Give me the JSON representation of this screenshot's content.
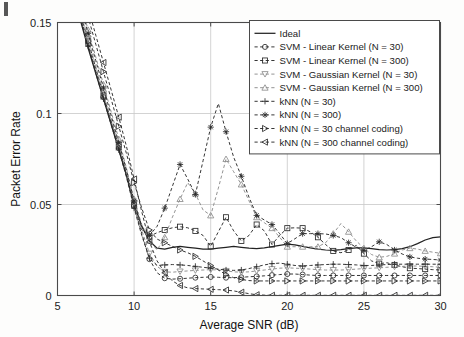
{
  "figure": {
    "background": "#fdfdfc",
    "axis_color": "#4a4a4a",
    "grid_color": "#c8c8c8",
    "series_color": "#2b2b2b",
    "gray_series_color": "#8d8d8d"
  },
  "axes": {
    "xlabel": "Average SNR (dB)",
    "ylabel": "Packet Error Rate",
    "xticks": [
      "5",
      "10",
      "15",
      "20",
      "25",
      "30"
    ],
    "yticks": [
      "0",
      "0.05",
      "0.1",
      "0.15"
    ],
    "xlim": [
      5,
      30
    ],
    "ylim": [
      0,
      0.15
    ],
    "grid": true
  },
  "legend": {
    "position": "top-right",
    "entries": [
      {
        "label": "Ideal",
        "marker": "none",
        "dash": "solid",
        "color": "#222222"
      },
      {
        "label": "SVM - Linear Kernel (N = 30)",
        "marker": "circle",
        "dash": "dashed",
        "color": "#2b2b2b"
      },
      {
        "label": "SVM - Linear Kernel (N = 300)",
        "marker": "square",
        "dash": "dashed",
        "color": "#2b2b2b"
      },
      {
        "label": "SVM - Gaussian Kernel (N = 30)",
        "marker": "triangle-down",
        "dash": "dashed",
        "color": "#8d8d8d"
      },
      {
        "label": "SVM - Gaussian Kernel (N = 300)",
        "marker": "triangle-up",
        "dash": "dashed",
        "color": "#8d8d8d"
      },
      {
        "label": "kNN (N = 30)",
        "marker": "plus",
        "dash": "dashed",
        "color": "#2b2b2b"
      },
      {
        "label": "kNN (N = 300)",
        "marker": "star",
        "dash": "dashed",
        "color": "#2b2b2b"
      },
      {
        "label": "kNN (N = 30 channel coding)",
        "marker": "triangle-right",
        "dash": "dashed",
        "color": "#2b2b2b"
      },
      {
        "label": "kNN (N = 300 channel coding)",
        "marker": "triangle-left",
        "dash": "dashed",
        "color": "#2b2b2b"
      }
    ]
  },
  "chart_data": {
    "type": "line",
    "title": "",
    "xlabel": "Average SNR (dB)",
    "ylabel": "Packet Error Rate",
    "xlim": [
      5,
      30
    ],
    "ylim": [
      0,
      0.15
    ],
    "grid": true,
    "legend_position": "top-right",
    "x": [
      5,
      5.5,
      6,
      6.5,
      7,
      7.5,
      8,
      8.5,
      9,
      9.5,
      10,
      10.5,
      11,
      11.5,
      12,
      12.5,
      13,
      13.5,
      14,
      14.5,
      15,
      15.5,
      16,
      16.5,
      17,
      17.5,
      18,
      18.5,
      19,
      19.5,
      20,
      20.5,
      21,
      21.5,
      22,
      22.5,
      23,
      23.5,
      24,
      24.5,
      25,
      25.5,
      26,
      26.5,
      27,
      27.5,
      28,
      28.5,
      29,
      29.5,
      30
    ],
    "series": [
      {
        "name": "Ideal",
        "marker": "none",
        "dash": "solid",
        "color": "#222222",
        "values": [
          0.196,
          0.181,
          0.166,
          0.151,
          0.136,
          0.122,
          0.108,
          0.094,
          0.08,
          0.066,
          0.05,
          0.038,
          0.03,
          0.026,
          0.0255,
          0.0265,
          0.027,
          0.0265,
          0.026,
          0.0255,
          0.0255,
          0.026,
          0.0265,
          0.027,
          0.0265,
          0.026,
          0.0258,
          0.0262,
          0.0268,
          0.0275,
          0.0282,
          0.0278,
          0.027,
          0.0262,
          0.0255,
          0.025,
          0.0248,
          0.0252,
          0.0258,
          0.0262,
          0.0262,
          0.0258,
          0.0252,
          0.025,
          0.0252,
          0.0258,
          0.0268,
          0.0285,
          0.0305,
          0.0318,
          0.0322
        ]
      },
      {
        "name": "SVM - Linear Kernel (N = 30)",
        "marker": "circle",
        "dash": "dashed",
        "color": "#2b2b2b",
        "values": [
          0.198,
          0.183,
          0.168,
          0.153,
          0.138,
          0.123,
          0.109,
          0.095,
          0.081,
          0.066,
          0.049,
          0.034,
          0.02,
          0.0125,
          0.0095,
          0.009,
          0.0092,
          0.0095,
          0.0098,
          0.01,
          0.0102,
          0.01,
          0.0098,
          0.0098,
          0.01,
          0.0103,
          0.0105,
          0.0108,
          0.0112,
          0.0115,
          0.0118,
          0.0118,
          0.0115,
          0.0112,
          0.011,
          0.011,
          0.011,
          0.011,
          0.011,
          0.011,
          0.011,
          0.011,
          0.011,
          0.011,
          0.011,
          0.011,
          0.011,
          0.011,
          0.011,
          0.011,
          0.011
        ]
      },
      {
        "name": "SVM - Linear Kernel (N = 300)",
        "marker": "square",
        "dash": "dashed",
        "color": "#2b2b2b",
        "values": [
          0.2,
          0.185,
          0.17,
          0.155,
          0.14,
          0.125,
          0.11,
          0.096,
          0.082,
          0.067,
          0.05,
          0.036,
          0.0325,
          0.0345,
          0.036,
          0.0372,
          0.0378,
          0.0372,
          0.0355,
          0.033,
          0.027,
          0.035,
          0.043,
          0.0355,
          0.03,
          0.033,
          0.039,
          0.0355,
          0.028,
          0.033,
          0.037,
          0.0372,
          0.037,
          0.035,
          0.032,
          0.028,
          0.0245,
          0.0235,
          0.025,
          0.0275,
          0.023,
          0.019,
          0.0175,
          0.018,
          0.0168,
          0.0158,
          0.015,
          0.0148,
          0.0145,
          0.0142,
          0.014
        ]
      },
      {
        "name": "SVM - Gaussian Kernel (N = 30)",
        "marker": "triangle-down",
        "dash": "dashed",
        "color": "#8d8d8d",
        "values": [
          0.201,
          0.186,
          0.171,
          0.156,
          0.141,
          0.126,
          0.111,
          0.097,
          0.083,
          0.068,
          0.051,
          0.036,
          0.023,
          0.016,
          0.013,
          0.0128,
          0.0132,
          0.0135,
          0.0138,
          0.014,
          0.0142,
          0.014,
          0.0135,
          0.013,
          0.0128,
          0.013,
          0.0135,
          0.014,
          0.0145,
          0.015,
          0.0152,
          0.015,
          0.0148,
          0.0145,
          0.0142,
          0.014,
          0.014,
          0.014,
          0.0142,
          0.0145,
          0.0148,
          0.015,
          0.0152,
          0.0155,
          0.0158,
          0.016,
          0.0162,
          0.0162,
          0.016,
          0.0158,
          0.0155
        ]
      },
      {
        "name": "SVM - Gaussian Kernel (N = 300)",
        "marker": "triangle-up",
        "dash": "dashed",
        "color": "#8d8d8d",
        "values": [
          0.206,
          0.191,
          0.176,
          0.161,
          0.146,
          0.131,
          0.116,
          0.101,
          0.086,
          0.07,
          0.053,
          0.039,
          0.03,
          0.025,
          0.032,
          0.043,
          0.053,
          0.062,
          0.056,
          0.047,
          0.044,
          0.059,
          0.075,
          0.068,
          0.061,
          0.052,
          0.043,
          0.04,
          0.037,
          0.032,
          0.0268,
          0.0268,
          0.0268,
          0.0268,
          0.0268,
          0.029,
          0.034,
          0.0395,
          0.035,
          0.03,
          0.026,
          0.0225,
          0.021,
          0.0215,
          0.023,
          0.025,
          0.026,
          0.0255,
          0.0245,
          0.0238,
          0.0232
        ]
      },
      {
        "name": "kNN (N = 30)",
        "marker": "plus",
        "dash": "dashed",
        "color": "#2b2b2b",
        "values": [
          0.197,
          0.182,
          0.167,
          0.152,
          0.137,
          0.122,
          0.108,
          0.094,
          0.08,
          0.065,
          0.048,
          0.033,
          0.0205,
          0.0165,
          0.0168,
          0.017,
          0.0168,
          0.0165,
          0.016,
          0.0155,
          0.015,
          0.0145,
          0.014,
          0.0138,
          0.014,
          0.0148,
          0.0158,
          0.0168,
          0.0175,
          0.0178,
          0.0172,
          0.0165,
          0.0162,
          0.0165,
          0.0168,
          0.017,
          0.0172,
          0.0172,
          0.017,
          0.0168,
          0.0165,
          0.0165,
          0.0168,
          0.017,
          0.0172,
          0.0172,
          0.0172,
          0.0172,
          0.0172,
          0.0172,
          0.0172
        ]
      },
      {
        "name": "kNN (N = 300)",
        "marker": "star",
        "dash": "dashed",
        "color": "#2b2b2b",
        "values": [
          0.204,
          0.189,
          0.174,
          0.159,
          0.144,
          0.129,
          0.114,
          0.099,
          0.084,
          0.069,
          0.052,
          0.038,
          0.033,
          0.038,
          0.048,
          0.06,
          0.072,
          0.064,
          0.0555,
          0.074,
          0.0925,
          0.1055,
          0.09,
          0.076,
          0.0655,
          0.054,
          0.044,
          0.0415,
          0.039,
          0.034,
          0.0285,
          0.0312,
          0.034,
          0.034,
          0.034,
          0.0338,
          0.033,
          0.0318,
          0.029,
          0.0265,
          0.0248,
          0.0268,
          0.0295,
          0.028,
          0.025,
          0.0228,
          0.0212,
          0.0205,
          0.02,
          0.0198,
          0.0195
        ]
      },
      {
        "name": "kNN (N = 30 channel coding)",
        "marker": "triangle-right",
        "dash": "dashed",
        "color": "#2b2b2b",
        "values": [
          0.213,
          0.198,
          0.183,
          0.168,
          0.153,
          0.138,
          0.123,
          0.108,
          0.093,
          0.078,
          0.062,
          0.048,
          0.036,
          0.031,
          0.029,
          0.027,
          0.025,
          0.0235,
          0.0215,
          0.019,
          0.0165,
          0.014,
          0.0115,
          0.0098,
          0.0088,
          0.0082,
          0.008,
          0.008,
          0.008,
          0.008,
          0.008,
          0.008,
          0.008,
          0.008,
          0.008,
          0.008,
          0.008,
          0.008,
          0.008,
          0.008,
          0.008,
          0.008,
          0.008,
          0.008,
          0.008,
          0.008,
          0.008,
          0.008,
          0.008,
          0.008,
          0.008
        ]
      },
      {
        "name": "kNN (N = 300 channel coding)",
        "marker": "triangle-left",
        "dash": "dashed",
        "color": "#2b2b2b",
        "values": [
          0.218,
          0.203,
          0.188,
          0.173,
          0.158,
          0.143,
          0.128,
          0.113,
          0.098,
          0.082,
          0.064,
          0.046,
          0.0295,
          0.019,
          0.0125,
          0.008,
          0.0055,
          0.0042,
          0.0038,
          0.0036,
          0.0034,
          0.0032,
          0.003,
          0.0025,
          0.0018,
          0.001,
          0.0004,
          0.0002,
          0.0001,
          0.0001,
          0.0001,
          0.0001,
          0.0001,
          0.0001,
          0.0001,
          0.0001,
          0.0001,
          0.0001,
          0.0001,
          0.0001,
          0.0001,
          0.0001,
          0.0001,
          0.0001,
          0.0001,
          0.0001,
          0.0001,
          0.0001,
          0.0001,
          0.0001,
          0.0001
        ]
      }
    ]
  }
}
